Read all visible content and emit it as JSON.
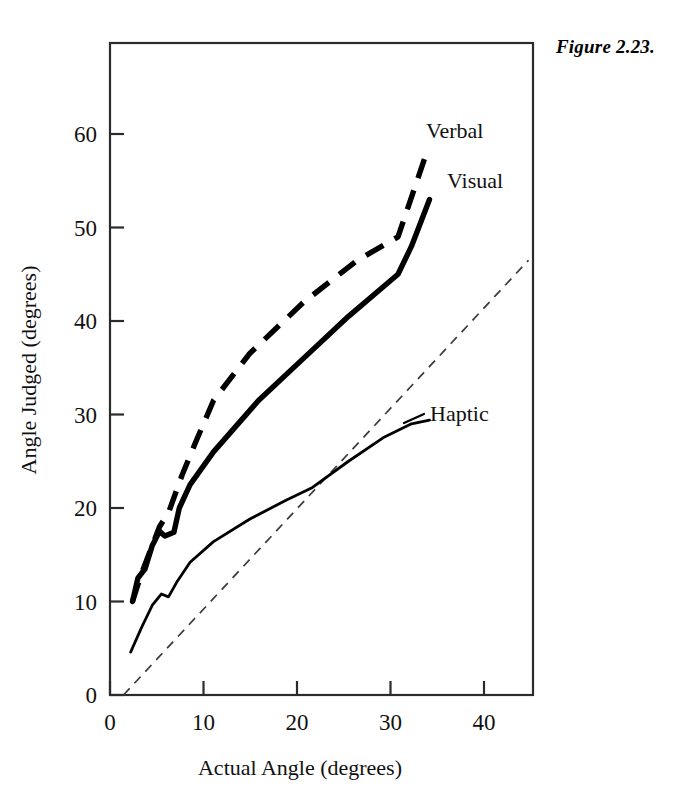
{
  "figure": {
    "caption": "Figure 2.23."
  },
  "chart_data": {
    "type": "line",
    "title": "",
    "xlabel": "Actual Angle (degrees)",
    "ylabel": "Angle Judged (degrees)",
    "xlim": [
      -1.5,
      45.5
    ],
    "ylim": [
      0,
      69
    ],
    "xticks": [
      0,
      10,
      20,
      30,
      40
    ],
    "yticks": [
      0,
      10,
      20,
      30,
      40,
      50,
      60
    ],
    "xtick_labels": [
      "0",
      "10",
      "20",
      "30",
      "40"
    ],
    "ytick_labels": [
      "0",
      "10",
      "20",
      "30",
      "40",
      "50",
      "60"
    ],
    "grid": false,
    "legend_position": "inline-annotations",
    "series": [
      {
        "name": "Verbal",
        "style": "thick-dashed",
        "label_x": 45.5,
        "label_y": 58.5,
        "points": [
          [
            1,
            10.0
          ],
          [
            2,
            13.0
          ],
          [
            3,
            15.5
          ],
          [
            4,
            18.0
          ],
          [
            5,
            19.5
          ],
          [
            6.5,
            23.5
          ],
          [
            8,
            27.0
          ],
          [
            10,
            31.5
          ],
          [
            14,
            36.5
          ],
          [
            20,
            42.0
          ],
          [
            26,
            46.5
          ],
          [
            30.5,
            49.0
          ],
          [
            33.5,
            57.5
          ]
        ]
      },
      {
        "name": "Visual",
        "style": "thick-solid",
        "label_x": 45.0,
        "label_y": 53.5,
        "points": [
          [
            1,
            10.0
          ],
          [
            1.6,
            12.5
          ],
          [
            2.4,
            13.5
          ],
          [
            3.2,
            16.0
          ],
          [
            4.0,
            17.5
          ],
          [
            4.6,
            17.0
          ],
          [
            5.6,
            17.4
          ],
          [
            6.2,
            20.0
          ],
          [
            7.4,
            22.5
          ],
          [
            10.0,
            26.0
          ],
          [
            15.0,
            31.5
          ],
          [
            20.0,
            36.0
          ],
          [
            25.0,
            40.5
          ],
          [
            30.5,
            45.0
          ],
          [
            32.0,
            48.0
          ],
          [
            34.0,
            53.0
          ]
        ]
      },
      {
        "name": "Haptic",
        "style": "thin-solid",
        "label_x": 39.5,
        "label_y": 30.0,
        "points": [
          [
            0.8,
            4.6
          ],
          [
            2.0,
            7.2
          ],
          [
            3.2,
            9.6
          ],
          [
            4.2,
            10.8
          ],
          [
            5.0,
            10.5
          ],
          [
            6.0,
            12.2
          ],
          [
            7.4,
            14.2
          ],
          [
            10.0,
            16.4
          ],
          [
            14.0,
            18.8
          ],
          [
            18.0,
            20.8
          ],
          [
            21.0,
            22.2
          ],
          [
            25.0,
            25.0
          ],
          [
            29.0,
            27.6
          ],
          [
            32.0,
            29.0
          ],
          [
            34.0,
            29.4
          ]
        ]
      },
      {
        "name": "Identity reference",
        "style": "thin-dashed",
        "points": [
          [
            0,
            0
          ],
          [
            45,
            46.5
          ]
        ]
      }
    ]
  }
}
